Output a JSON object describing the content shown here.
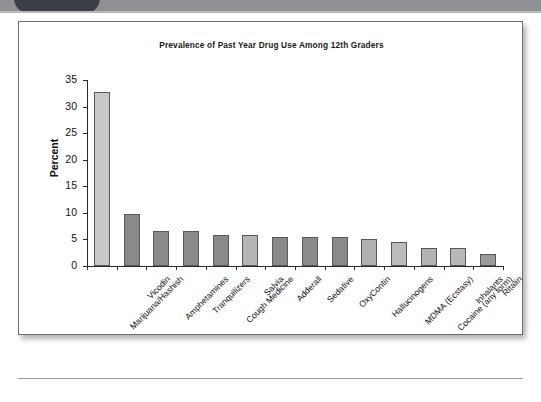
{
  "header": {
    "tab_label": "",
    "band_color": "#8e9094",
    "tab_color": "#3b3f45"
  },
  "figure": {
    "border_color": "#6e6e6e",
    "background": "#ffffff"
  },
  "chart_data": {
    "type": "bar",
    "title": "Prevalence of Past Year Drug Use Among 12th Graders",
    "xlabel": "",
    "ylabel": "Percent",
    "ylim": [
      0,
      35
    ],
    "yticks": [
      0,
      5,
      10,
      15,
      20,
      25,
      30,
      35
    ],
    "ytick_labels": [
      "0",
      "5",
      "10",
      "15",
      "20",
      "25",
      "30",
      "35"
    ],
    "grid": false,
    "legend": "none",
    "categories": [
      "Marijuana/Hashish",
      "Vicodin",
      "Amphetamines",
      "Tranquilizers",
      "Cough Medicine",
      "Salvia",
      "Adderall",
      "Sedative",
      "OxyContin",
      "Hallucinogens",
      "MDMA (Ecstasy)",
      "Cocaine (any form)",
      "Inhalants",
      "Ritalin"
    ],
    "values": [
      32.8,
      9.7,
      6.6,
      6.6,
      5.8,
      5.8,
      5.4,
      5.4,
      5.4,
      5.0,
      4.5,
      3.4,
      3.4,
      2.2
    ],
    "bar_colors": [
      "#c9c9c9",
      "#8a8a8a",
      "#8a8a8a",
      "#8a8a8a",
      "#8a8a8a",
      "#b5b5b5",
      "#8a8a8a",
      "#8a8a8a",
      "#8a8a8a",
      "#b0b0b0",
      "#bcbcbc",
      "#b2b2b2",
      "#b8b8b8",
      "#9a9a9a"
    ]
  }
}
